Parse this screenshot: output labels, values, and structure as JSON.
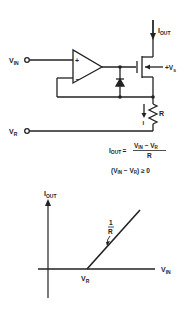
{
  "circuit": {
    "input_label": "V",
    "input_sub": "IN",
    "ref_label": "V",
    "ref_sub": "R",
    "output_current_label": "I",
    "output_current_sub": "OUT",
    "supply_label": "+V",
    "supply_sub": "s",
    "resistor_label": "R",
    "current_arrow_label": "I",
    "opamp_plus": "+",
    "opamp_minus": "−"
  },
  "equations": {
    "lhs": "I",
    "lhs_sub": "OUT",
    "equals": "=",
    "numerator": "V",
    "num_sub_in": "IN",
    "num_minus": " − V",
    "num_sub_r": "R",
    "denominator": "R",
    "condition": "(V",
    "cond_sub_in": "IN",
    "cond_mid": " − V",
    "cond_sub_r": "R",
    "cond_end": ") ≥ 0"
  },
  "graph": {
    "y_label": "I",
    "y_sub": "OUT",
    "x_label": "V",
    "x_sub": "IN",
    "break_label": "V",
    "break_sub": "R",
    "slope_num": "1",
    "slope_den": "R"
  },
  "colors": {
    "ink": "#222222",
    "background": "#ffffff"
  }
}
